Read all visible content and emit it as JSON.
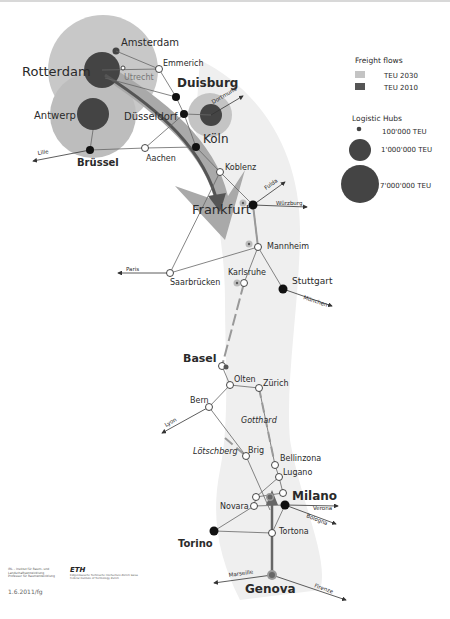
{
  "legend": {
    "flows_title": "Freight flows",
    "flows": [
      {
        "label": "TEU 2030",
        "color": "#c4c4c4"
      },
      {
        "label": "TEU 2010",
        "color": "#555555"
      }
    ],
    "hubs_title": "Logistic Hubs",
    "hubs": [
      {
        "label": "100'000 TEU"
      },
      {
        "label": "1'000'000 TEU"
      },
      {
        "label": "7'000'000 TEU"
      }
    ]
  },
  "cities": {
    "amsterdam": "Amsterdam",
    "rotterdam": "Rotterdam",
    "utrecht": "Utrecht",
    "emmerich": "Emmerich",
    "duisburg": "Duisburg",
    "antwerp": "Antwerp",
    "dusseldorf": "Düsseldorf",
    "koln": "Köln",
    "brussel": "Brüssel",
    "aachen": "Aachen",
    "koblenz": "Koblenz",
    "frankfurt": "Frankfurt",
    "mannheim": "Mannheim",
    "saarbrucken": "Saarbrücken",
    "karlsruhe": "Karlsruhe",
    "stuttgart": "Stuttgart",
    "basel": "Basel",
    "olten": "Olten",
    "zurich": "Zürich",
    "bern": "Bern",
    "gotthard": "Gotthard",
    "lotschberg": "Lötschberg",
    "brig": "Brig",
    "bellinzona": "Bellinzona",
    "lugano": "Lugano",
    "milano": "Milano",
    "novara": "Novara",
    "tortona": "Tortona",
    "torino": "Torino",
    "genova": "Genova"
  },
  "directions": {
    "lille": "Lille",
    "dortmund": "Dortmund",
    "fulda": "Fulda",
    "wurzburg": "Würzburg",
    "paris": "Paris",
    "munchen": "München",
    "lyon": "Lyon",
    "verona": "Verona",
    "bologna": "Bologna",
    "marseille": "Marseille",
    "firenze": "Firenze"
  },
  "footer": {
    "institute": "IRL – Institut für Raum- und Landschaftsentwicklung Professur für Raumentwicklung",
    "eth": "ETH",
    "eth_sub": "Eidgenössische Technische Hochschule Zürich Swiss Federal Institute of Technology Zurich",
    "code": "1.6.2011/fg"
  }
}
